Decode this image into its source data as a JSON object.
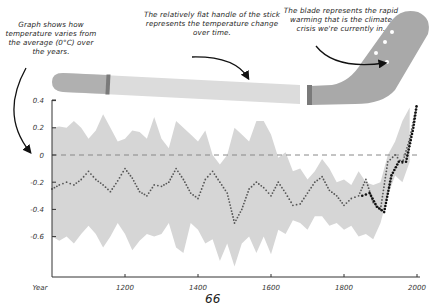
{
  "annotations": {
    "left": "Graph shows how temperature varies from the average (0°C) over the years.",
    "middle": "The relatively flat handle of the stick represents the temperature change over time.",
    "right": "The blade represents the rapid warming that is the climate crisis we're currently in."
  },
  "page_number": "66",
  "colors": {
    "band": "#d6d6d6",
    "stick_handle": "#dcdcdc",
    "stick_blade": "#a9a9a9",
    "stick_bands": "#7a7a7a",
    "dots": "#555555",
    "recent_dots": "#111111",
    "baseline": "#888888",
    "axis": "#333333"
  },
  "chart_data": {
    "type": "line",
    "title": "",
    "xlabel": "Year",
    "ylabel": "",
    "x_ticks": [
      "1200",
      "1400",
      "1600",
      "1800",
      "2000"
    ],
    "y_ticks": [
      "0.4",
      "0.2",
      "0",
      "-0.2",
      "-0.4",
      "-0.6"
    ],
    "xlim": [
      1000,
      2000
    ],
    "ylim": [
      -0.85,
      0.45
    ],
    "grid": false,
    "baseline": {
      "value": 0,
      "style": "dashed"
    },
    "series": [
      {
        "name": "Reconstructed temperature anomaly (°C)",
        "style": "dotted",
        "x": [
          1000,
          1020,
          1040,
          1060,
          1080,
          1100,
          1120,
          1140,
          1160,
          1180,
          1200,
          1220,
          1240,
          1260,
          1280,
          1300,
          1320,
          1340,
          1360,
          1380,
          1400,
          1420,
          1440,
          1460,
          1480,
          1500,
          1520,
          1540,
          1560,
          1580,
          1600,
          1620,
          1640,
          1660,
          1680,
          1700,
          1720,
          1740,
          1760,
          1780,
          1800,
          1820,
          1840,
          1860,
          1880,
          1900,
          1920,
          1940,
          1960,
          1980,
          2000
        ],
        "values": [
          -0.25,
          -0.22,
          -0.2,
          -0.22,
          -0.18,
          -0.12,
          -0.18,
          -0.22,
          -0.27,
          -0.19,
          -0.1,
          -0.17,
          -0.27,
          -0.3,
          -0.22,
          -0.23,
          -0.2,
          -0.1,
          -0.18,
          -0.28,
          -0.32,
          -0.18,
          -0.12,
          -0.2,
          -0.28,
          -0.5,
          -0.4,
          -0.25,
          -0.2,
          -0.24,
          -0.3,
          -0.2,
          -0.28,
          -0.37,
          -0.36,
          -0.28,
          -0.2,
          -0.16,
          -0.26,
          -0.3,
          -0.37,
          -0.32,
          -0.3,
          -0.18,
          -0.35,
          -0.4,
          -0.05,
          0.0,
          -0.06,
          0.12,
          0.38
        ]
      },
      {
        "name": "Instrumental record",
        "style": "dotted-bold",
        "x": [
          1850,
          1870,
          1890,
          1910,
          1930,
          1950,
          1970,
          1990,
          2000
        ],
        "values": [
          -0.3,
          -0.28,
          -0.38,
          -0.42,
          -0.15,
          -0.05,
          -0.05,
          0.2,
          0.38
        ]
      }
    ],
    "uncertainty_band": {
      "x": [
        1000,
        1020,
        1040,
        1060,
        1080,
        1100,
        1120,
        1140,
        1160,
        1180,
        1200,
        1220,
        1240,
        1260,
        1280,
        1300,
        1320,
        1340,
        1360,
        1380,
        1400,
        1420,
        1440,
        1460,
        1480,
        1500,
        1520,
        1540,
        1560,
        1580,
        1600,
        1620,
        1640,
        1660,
        1680,
        1700,
        1720,
        1740,
        1760,
        1780,
        1800,
        1820,
        1840,
        1860,
        1880,
        1900,
        1920,
        1940,
        1960,
        1980
      ],
      "upper": [
        0.2,
        0.21,
        0.2,
        0.25,
        0.2,
        0.12,
        0.18,
        0.3,
        0.2,
        0.1,
        0.12,
        0.18,
        0.17,
        0.12,
        0.28,
        0.12,
        0.05,
        0.25,
        0.2,
        0.15,
        0.1,
        0.18,
        0.0,
        -0.07,
        0.0,
        0.2,
        0.15,
        0.1,
        0.25,
        0.25,
        0.15,
        -0.02,
        0.02,
        -0.12,
        -0.1,
        -0.18,
        -0.12,
        -0.03,
        -0.1,
        -0.2,
        -0.18,
        -0.22,
        -0.12,
        -0.2,
        -0.22,
        -0.2,
        0.0,
        0.1,
        0.25,
        0.35
      ],
      "lower": [
        -0.6,
        -0.63,
        -0.6,
        -0.65,
        -0.58,
        -0.52,
        -0.58,
        -0.68,
        -0.6,
        -0.5,
        -0.58,
        -0.7,
        -0.63,
        -0.58,
        -0.6,
        -0.58,
        -0.5,
        -0.68,
        -0.72,
        -0.5,
        -0.55,
        -0.65,
        -0.62,
        -0.78,
        -0.65,
        -0.82,
        -0.65,
        -0.6,
        -0.72,
        -0.6,
        -0.73,
        -0.55,
        -0.58,
        -0.48,
        -0.5,
        -0.55,
        -0.45,
        -0.45,
        -0.52,
        -0.5,
        -0.55,
        -0.52,
        -0.6,
        -0.58,
        -0.62,
        -0.5,
        -0.3,
        -0.15,
        -0.2,
        -0.05
      ]
    }
  }
}
